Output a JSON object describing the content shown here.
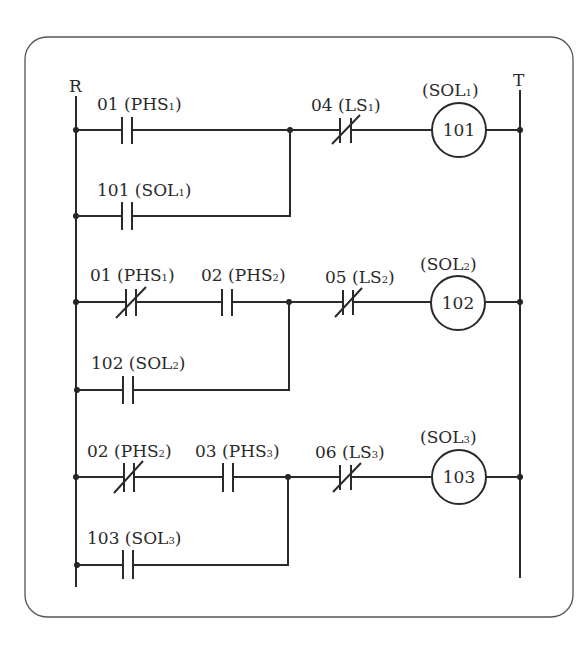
{
  "diagram": {
    "type": "ladder-diagram",
    "rails": {
      "left": "R",
      "right": "T"
    },
    "rungs": [
      {
        "main_contacts": [
          {
            "address": "01",
            "name": "PHS",
            "sub": "1",
            "type": "NO"
          }
        ],
        "seal_contact": {
          "address": "101",
          "name": "SOL",
          "sub": "1",
          "type": "NO"
        },
        "series_contact": {
          "address": "04",
          "name": "LS",
          "sub": "1",
          "type": "NC"
        },
        "coil": {
          "address": "101",
          "name": "SOL",
          "sub": "1"
        }
      },
      {
        "main_contacts": [
          {
            "address": "01",
            "name": "PHS",
            "sub": "1",
            "type": "NC"
          },
          {
            "address": "02",
            "name": "PHS",
            "sub": "2",
            "type": "NO"
          }
        ],
        "seal_contact": {
          "address": "102",
          "name": "SOL",
          "sub": "2",
          "type": "NO"
        },
        "series_contact": {
          "address": "05",
          "name": "LS",
          "sub": "2",
          "type": "NC"
        },
        "coil": {
          "address": "102",
          "name": "SOL",
          "sub": "2"
        }
      },
      {
        "main_contacts": [
          {
            "address": "02",
            "name": "PHS",
            "sub": "2",
            "type": "NC"
          },
          {
            "address": "03",
            "name": "PHS",
            "sub": "3",
            "type": "NO"
          }
        ],
        "seal_contact": {
          "address": "103",
          "name": "SOL",
          "sub": "3",
          "type": "NO"
        },
        "series_contact": {
          "address": "06",
          "name": "LS",
          "sub": "3",
          "type": "NC"
        },
        "coil": {
          "address": "103",
          "name": "SOL",
          "sub": "3"
        }
      }
    ]
  }
}
